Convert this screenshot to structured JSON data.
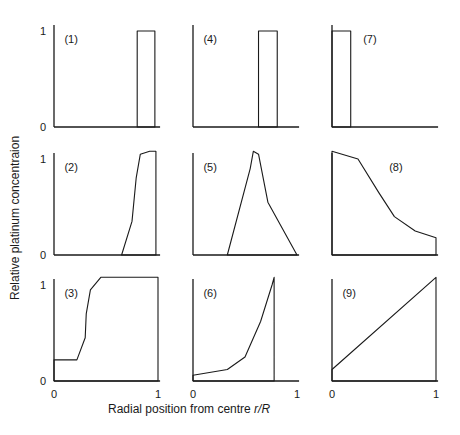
{
  "chart_data": {
    "type": "area",
    "title": "",
    "xlabel": "Radial position from centre",
    "xlabel_var": "r/R",
    "ylabel": "Relative platinum concentraion",
    "layout": {
      "rows": 3,
      "cols": 3,
      "shared_x_ticks_bottom_row": true,
      "grid": false
    },
    "panels": [
      {
        "id": "(1)",
        "row": 0,
        "col": 0,
        "shape": "band",
        "x_range": [
          0.8,
          0.97
        ],
        "y": 1,
        "yticks": [
          "0",
          "1"
        ]
      },
      {
        "id": "(2)",
        "row": 1,
        "col": 0,
        "shape": "shell-curve",
        "points": [
          [
            0.65,
            0
          ],
          [
            0.75,
            0.35
          ],
          [
            0.79,
            0.8
          ],
          [
            0.83,
            1.05
          ],
          [
            0.92,
            1.08
          ],
          [
            0.98,
            1.08
          ],
          [
            0.98,
            0
          ]
        ],
        "yticks": [
          "0",
          "1"
        ]
      },
      {
        "id": "(3)",
        "row": 2,
        "col": 0,
        "shape": "step-curve",
        "points": [
          [
            0,
            0.22
          ],
          [
            0.22,
            0.22
          ],
          [
            0.3,
            0.45
          ],
          [
            0.31,
            0.7
          ],
          [
            0.35,
            0.95
          ],
          [
            0.45,
            1.08
          ],
          [
            1.0,
            1.08
          ],
          [
            1.0,
            0
          ],
          [
            0,
            0
          ]
        ],
        "yticks": [
          "0",
          "1"
        ],
        "xticks": [
          "0",
          "1"
        ]
      },
      {
        "id": "(4)",
        "row": 0,
        "col": 1,
        "shape": "band",
        "x_range": [
          0.63,
          0.81
        ],
        "y": 1
      },
      {
        "id": "(5)",
        "row": 1,
        "col": 1,
        "shape": "peak",
        "points": [
          [
            0.33,
            0
          ],
          [
            0.55,
            0.9
          ],
          [
            0.58,
            1.08
          ],
          [
            0.63,
            1.05
          ],
          [
            0.72,
            0.55
          ],
          [
            1.0,
            0
          ]
        ]
      },
      {
        "id": "(6)",
        "row": 2,
        "col": 1,
        "shape": "rising-curve",
        "points": [
          [
            0,
            0.06
          ],
          [
            0.33,
            0.12
          ],
          [
            0.5,
            0.25
          ],
          [
            0.65,
            0.62
          ],
          [
            0.76,
            1.0
          ],
          [
            0.78,
            1.08
          ],
          [
            0.78,
            0
          ]
        ],
        "xticks": [
          "0",
          "1"
        ]
      },
      {
        "id": "(7)",
        "row": 0,
        "col": 2,
        "shape": "band",
        "x_range": [
          0.0,
          0.18
        ],
        "y": 1
      },
      {
        "id": "(8)",
        "row": 1,
        "col": 2,
        "shape": "decaying-curve",
        "points": [
          [
            0,
            1.08
          ],
          [
            0.25,
            1.0
          ],
          [
            0.45,
            0.65
          ],
          [
            0.6,
            0.4
          ],
          [
            0.8,
            0.25
          ],
          [
            1.0,
            0.18
          ],
          [
            1.0,
            0
          ]
        ]
      },
      {
        "id": "(9)",
        "row": 2,
        "col": 2,
        "shape": "linear",
        "points": [
          [
            0,
            0.12
          ],
          [
            1.0,
            1.08
          ]
        ],
        "xticks": [
          "0",
          "1"
        ]
      }
    ]
  }
}
